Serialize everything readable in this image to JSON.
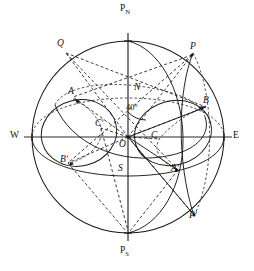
{
  "figure": {
    "type": "astronomical-sphere-projection",
    "width": 254,
    "height": 271,
    "background_color": "#ffffff",
    "line_color": "#1a1a1a"
  },
  "geometry": {
    "sphere": {
      "cx": 128,
      "cy": 137,
      "r": 96
    },
    "observer_origin": {
      "x": 128,
      "y": 137
    },
    "latitude_angle_degrees": 40,
    "polar_axis": {
      "north": {
        "x": 128,
        "y": 41
      },
      "south": {
        "x": 128,
        "y": 233
      }
    },
    "horizon_axis": {
      "west": {
        "x": 32,
        "y": 137
      },
      "east": {
        "x": 224,
        "y": 137
      }
    }
  },
  "labels": {
    "north_pole": {
      "text": "P",
      "sub": "N",
      "x": 121,
      "y": 8
    },
    "south_pole": {
      "text": "P",
      "sub": "S",
      "x": 121,
      "y": 248
    },
    "west": {
      "text": "W",
      "x": 11,
      "y": 130
    },
    "east": {
      "text": "E",
      "x": 234,
      "y": 130
    },
    "zenith_north": {
      "text": "N",
      "x": 135,
      "y": 83
    },
    "nadir_south": {
      "text": "S",
      "x": 119,
      "y": 164
    },
    "origin": {
      "text": "O",
      "x": 121,
      "y": 141
    },
    "star_p": {
      "text": "P",
      "x": 191,
      "y": 44
    },
    "star_p_prime": {
      "text": "Pʹ",
      "x": 191,
      "y": 212
    },
    "point_q": {
      "text": "Q",
      "x": 58,
      "y": 40
    },
    "point_a_left": {
      "text": "A",
      "x": 69,
      "y": 88
    },
    "point_a_prime": {
      "text": "Aʹ",
      "x": 172,
      "y": 165
    },
    "point_b_right": {
      "text": "B",
      "x": 204,
      "y": 97
    },
    "point_b_prime": {
      "text": "Bʹ",
      "x": 61,
      "y": 156
    },
    "point_c": {
      "text": "C",
      "x": 152,
      "y": 132
    },
    "point_c_prime": {
      "text": "Cʹ",
      "x": 96,
      "y": 120
    },
    "angle_40": {
      "text": "40°",
      "x": 128,
      "y": 105
    }
  },
  "elements": {
    "sphere_outline": "great circle horizon of celestial sphere",
    "horizon_ellipse": "horizon plane seen in perspective",
    "equator_ellipse": "celestial equator seen in perspective",
    "meridian_solid": "hour circle through P and P-prime",
    "diurnal_circle_left": "small circle through A and B-prime",
    "diurnal_circle_right": "small circle through B and A-prime",
    "radii_dashed": "construction radii from O to Q, P, A, B, A-prime, B-prime",
    "polar_axis_label": "PN - PS rotational axis",
    "cardinal_axis_label": "W - E horizon line"
  }
}
